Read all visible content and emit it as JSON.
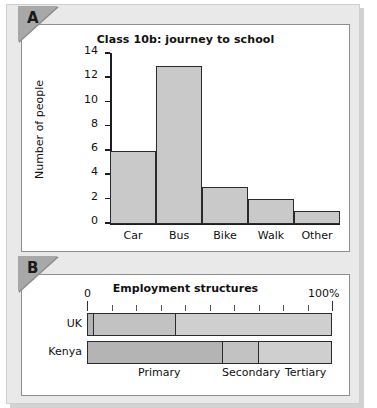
{
  "figure": {
    "panels": [
      {
        "marker": "A",
        "kind": "bar-chart"
      },
      {
        "marker": "B",
        "kind": "stacked-bar-chart"
      }
    ]
  },
  "chart_data": [
    {
      "type": "bar",
      "panel_label": "A",
      "title": "Class 10b: journey to school",
      "xlabel": "",
      "ylabel": "Number of people",
      "categories": [
        "Car",
        "Bus",
        "Bike",
        "Walk",
        "Other"
      ],
      "values": [
        6,
        13,
        3,
        2,
        1
      ],
      "ylim": [
        0,
        14
      ],
      "yticks": [
        0,
        2,
        4,
        6,
        8,
        10,
        12,
        14
      ],
      "ytick_labels": [
        "0",
        "2",
        "4",
        "6",
        "8",
        "10",
        "12",
        "14"
      ],
      "grid": false,
      "legend": "none",
      "bar_fill": "#c9c9c9",
      "bar_edge": "#2b2b2b"
    },
    {
      "type": "bar",
      "orientation": "horizontal",
      "stacked": true,
      "panel_label": "B",
      "title": "Employment structures",
      "xlabel": "",
      "ylabel": "",
      "categories": [
        "UK",
        "Kenya"
      ],
      "series": [
        {
          "name": "Primary",
          "values": [
            2,
            55
          ],
          "color": "#b4b4b4"
        },
        {
          "name": "Secondary",
          "values": [
            34,
            15
          ],
          "color": "#c2c2c2"
        },
        {
          "name": "Tertiary",
          "values": [
            64,
            30
          ],
          "color": "#cfcfcf"
        }
      ],
      "xlim": [
        0,
        100
      ],
      "xticks": [
        0,
        10,
        20,
        30,
        40,
        50,
        60,
        70,
        80,
        90,
        100
      ],
      "scale_start_label": "0",
      "scale_end_label": "100%",
      "segment_labels": [
        "Primary",
        "Secondary",
        "Tertiary"
      ],
      "grid": false,
      "legend": "bottom-inline"
    }
  ]
}
